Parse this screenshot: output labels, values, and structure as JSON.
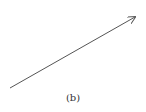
{
  "diagram": {
    "caption": "(b)",
    "arrow": {
      "x1": 10,
      "y1": 88,
      "x2": 135,
      "y2": 17,
      "color": "#555555",
      "stroke_width": 1
    },
    "background": "#ffffff"
  }
}
